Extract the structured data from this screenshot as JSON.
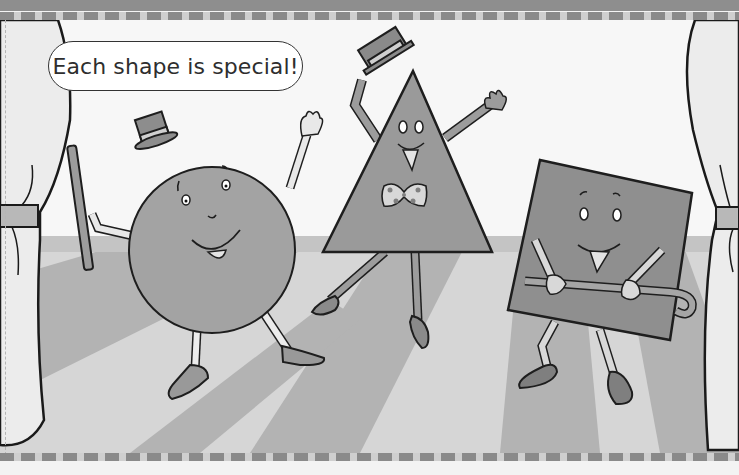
{
  "illustration": {
    "caption": "Each shape is special!",
    "characters": [
      {
        "shape": "circle",
        "accessories": [
          "top-hat",
          "cane"
        ]
      },
      {
        "shape": "triangle",
        "accessories": [
          "straw-hat",
          "polka-dot-bow-tie"
        ]
      },
      {
        "shape": "square",
        "accessories": [
          "cane"
        ]
      }
    ],
    "setting": "stage-with-curtains",
    "colors": {
      "background": "#f4f4f4",
      "floor_light": "#d9d9d9",
      "floor_dark": "#b0b0b0",
      "shape_fill": "#9a9a9a",
      "outline": "#1e1e1e"
    }
  }
}
